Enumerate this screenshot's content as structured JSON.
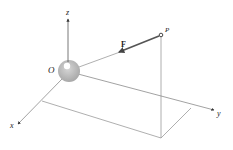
{
  "diagram": {
    "type": "3d-force-vector",
    "labels": {
      "origin": "O",
      "point": "P",
      "force": "F",
      "x_axis": "x",
      "y_axis": "y",
      "z_axis": "z"
    },
    "colors": {
      "line": "#8a8a8a",
      "force_arrow": "#555555",
      "sphere": "#b5b5b5",
      "sphere_highlight": "#ffffff",
      "text": "#222222"
    }
  }
}
